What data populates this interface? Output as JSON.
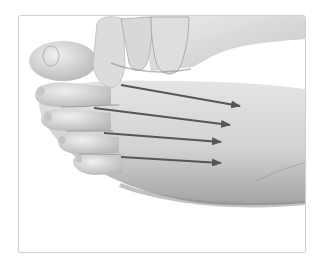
{
  "figure": {
    "alt": "Hand pressing between toes of a foot with four arrows pointing along the metatarsal spaces toward the ankle",
    "style": "grayscale photograph",
    "colors": {
      "background": "#ffffff",
      "frame_border": "#cfcfcf",
      "skin_light": "#e6e6e6",
      "skin_mid": "#c8c8c8",
      "skin_shadow": "#9a9a9a",
      "arrow": "#565656"
    },
    "arrows": [
      {
        "id": 1,
        "x1": 120,
        "y1": 84,
        "x2": 239,
        "y2": 105
      },
      {
        "id": 2,
        "x1": 93,
        "y1": 107,
        "x2": 229,
        "y2": 124
      },
      {
        "id": 3,
        "x1": 103,
        "y1": 132,
        "x2": 220,
        "y2": 141
      },
      {
        "id": 4,
        "x1": 120,
        "y1": 156,
        "x2": 220,
        "y2": 162
      }
    ],
    "arrow_count": "4"
  }
}
